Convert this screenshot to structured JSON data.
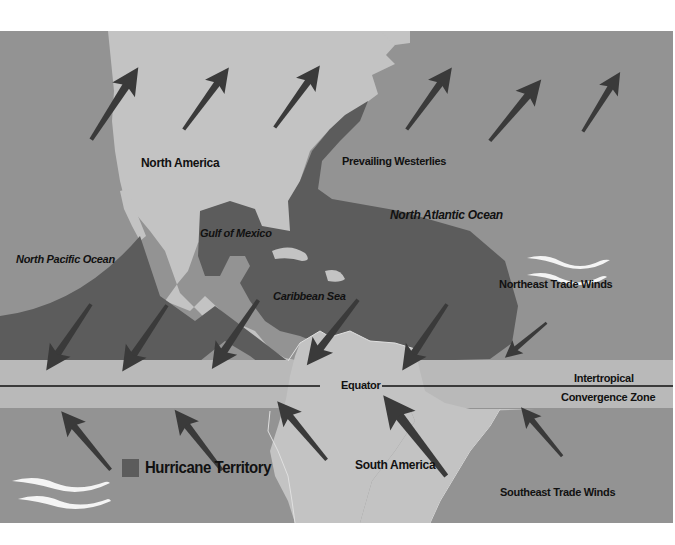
{
  "map": {
    "colors": {
      "ocean": "#939393",
      "land": "#c3c3c3",
      "hurricane_territory": "#5c5c5c",
      "itcz_band": "#b9b9b9",
      "arrow": "#3a3a3a",
      "wave": "#f4f4f4"
    },
    "labels": {
      "north_america": "North America",
      "prevailing_westerlies": "Prevailing Westerlies",
      "north_atlantic_ocean": "North Atlantic Ocean",
      "gulf_of_mexico": "Gulf of Mexico",
      "north_pacific_ocean": "North Pacific Ocean",
      "caribbean_sea": "Caribbean Sea",
      "northeast_trade_winds": "Northeast Trade Winds",
      "intertropical": "Intertropical",
      "equator": "Equator",
      "convergence_zone": "Convergence Zone",
      "south_america": "South America",
      "southeast_trade_winds": "Southeast Trade Winds"
    },
    "legend": {
      "label": "Hurricane Territory",
      "icon": "gray-square-swatch"
    },
    "icons": {
      "wind_arrow": "arrow-icon",
      "water_waves": "waves-icon"
    }
  }
}
